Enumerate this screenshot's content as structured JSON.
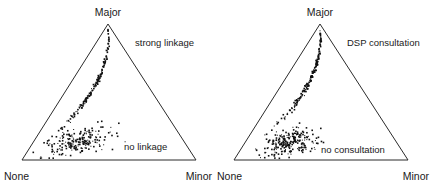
{
  "figure": {
    "width": 433,
    "height": 190,
    "background": "#ffffff",
    "ink_color": "#1a1a1a",
    "point_color": "#111111"
  },
  "chart_data": [
    {
      "type": "scatter",
      "subtype": "ternary",
      "panel": "left",
      "title": "",
      "xlabel": "",
      "ylabel": "",
      "grid": false,
      "legend_position": "inline-annotation",
      "vertices": {
        "top": "Major",
        "bottom_left": "None",
        "bottom_right": "Minor"
      },
      "annotations": [
        {
          "text": "strong linkage",
          "x": 135,
          "y": 46,
          "anchor": "start"
        },
        {
          "text": "no linkage",
          "x": 124,
          "y": 150,
          "anchor": "start"
        }
      ],
      "clusters": [
        {
          "name": "strong linkage",
          "n": 150,
          "center": [
            0.12,
            0.56
          ],
          "spread": [
            0.055,
            0.175
          ],
          "correlation": 0.55
        },
        {
          "name": "no linkage",
          "n": 210,
          "center": [
            0.3,
            0.13
          ],
          "spread": [
            0.1,
            0.055
          ],
          "correlation": 0.35
        }
      ]
    },
    {
      "type": "scatter",
      "subtype": "ternary",
      "panel": "right",
      "title": "",
      "xlabel": "",
      "ylabel": "",
      "grid": false,
      "legend_position": "inline-annotation",
      "vertices": {
        "top": "Major",
        "bottom_left": "None",
        "bottom_right": "Minor"
      },
      "annotations": [
        {
          "text": "DSP consultation",
          "x": 130,
          "y": 46,
          "anchor": "start"
        },
        {
          "text": "no consultation",
          "x": 104,
          "y": 153,
          "anchor": "start"
        }
      ],
      "clusters": [
        {
          "name": "DSP consultation",
          "n": 170,
          "center": [
            0.115,
            0.58
          ],
          "spread": [
            0.058,
            0.18
          ],
          "correlation": 0.55
        },
        {
          "name": "no consultation",
          "n": 230,
          "center": [
            0.295,
            0.125
          ],
          "spread": [
            0.085,
            0.05
          ],
          "correlation": 0.3
        }
      ]
    }
  ],
  "panels": {
    "left": {
      "vertex_top_label": "Major",
      "vertex_left_label": "None",
      "vertex_right_label": "Minor",
      "annotation_upper": "strong linkage",
      "annotation_lower": "no linkage"
    },
    "right": {
      "vertex_top_label": "Major",
      "vertex_left_label": "None",
      "vertex_right_label": "Minor",
      "annotation_upper": "DSP consultation",
      "annotation_lower": "no consultation"
    }
  }
}
